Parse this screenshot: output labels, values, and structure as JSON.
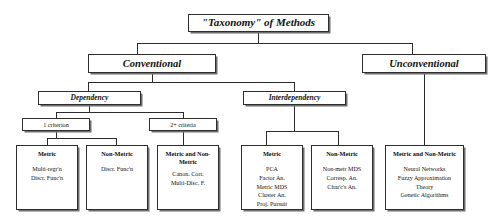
{
  "diagram": {
    "title": "\"Taxonomy\" of Methods",
    "root": {
      "label": "\"Taxonomy\" of Methods"
    },
    "level2": [
      {
        "label": "Conventional"
      },
      {
        "label": "Unconventional"
      }
    ],
    "level3": [
      {
        "label": "Dependency"
      },
      {
        "label": "Interdependency"
      }
    ],
    "level4": [
      {
        "label": "1 criterion"
      },
      {
        "label": "2+ criteria"
      }
    ],
    "leaves": [
      {
        "title": "Metric",
        "items": [
          "Multi-regr'n",
          "Discr. Func'n"
        ]
      },
      {
        "title": "Non-Metric",
        "items": [
          "Discr. Func'n"
        ]
      },
      {
        "title": "Metric and Non-Metric",
        "items": [
          "Canon. Corr.",
          "Multi-Disc. F."
        ]
      },
      {
        "title": "Metric",
        "items": [
          "PCA",
          "Factor An.",
          "Metric MDS",
          "Cluster An.",
          "Proj. Pursuit"
        ]
      },
      {
        "title": "Non-Metric",
        "items": [
          "Non-metr MDS",
          "Corresp. An.",
          "Char'c's An."
        ]
      },
      {
        "title": "Metric and Non-Metric",
        "items": [
          "Neural Networks",
          "Fuzzy Approximation",
          "Theory",
          "Genetic Algorithms"
        ]
      }
    ],
    "colors": {
      "box_fill": "#ffffff",
      "box_border": "#2e2e2e",
      "box_shadow": "#6e6e6e",
      "connector": "#2b2b2b",
      "text": "#111111",
      "background": "#ffffff"
    }
  }
}
